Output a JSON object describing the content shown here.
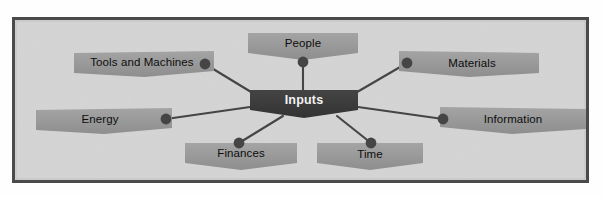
{
  "diagram": {
    "type": "mind-map",
    "title_node": "Inputs",
    "frame": {
      "border_color": "#4a4a4a",
      "background_color": "#d4d4d4",
      "page_color": "#fefefe"
    },
    "colors": {
      "center_fill": "#3c3c3c",
      "center_text": "#f2f2f2",
      "node_fill": "#9a9a9a",
      "node_text": "#0d0d0d",
      "connector": "#454545",
      "dot": "#454545"
    },
    "center": {
      "label": "Inputs",
      "x": 304,
      "y": 103,
      "width": 108,
      "height": 27
    },
    "nodes": [
      {
        "id": "tools-and-machines",
        "label": "Tools and Machines",
        "shape": "ribbon-left",
        "box": {
          "x": 74,
          "y": 51,
          "width": 140,
          "height": 26
        },
        "text_x": 142,
        "text_y": 64,
        "dot": {
          "x": 205,
          "y": 64
        }
      },
      {
        "id": "people",
        "label": "People",
        "shape": "ribbon-notch",
        "box": {
          "x": 248,
          "y": 33,
          "width": 110,
          "height": 26
        },
        "text_x": 303,
        "text_y": 45,
        "dot": {
          "x": 303,
          "y": 62
        }
      },
      {
        "id": "materials",
        "label": "Materials",
        "shape": "ribbon-right",
        "box": {
          "x": 399,
          "y": 51,
          "width": 140,
          "height": 26
        },
        "text_x": 472,
        "text_y": 65,
        "dot": {
          "x": 407,
          "y": 63
        }
      },
      {
        "id": "energy",
        "label": "Energy",
        "shape": "ribbon-left",
        "box": {
          "x": 36,
          "y": 108,
          "width": 136,
          "height": 26
        },
        "text_x": 100,
        "text_y": 121,
        "dot": {
          "x": 166,
          "y": 119
        }
      },
      {
        "id": "information",
        "label": "Information",
        "shape": "ribbon-right",
        "box": {
          "x": 440,
          "y": 107,
          "width": 146,
          "height": 26
        },
        "text_x": 513,
        "text_y": 121,
        "dot": {
          "x": 443,
          "y": 119
        }
      },
      {
        "id": "finances",
        "label": "Finances",
        "shape": "ribbon-notch",
        "box": {
          "x": 185,
          "y": 143,
          "width": 112,
          "height": 26
        },
        "text_x": 241,
        "text_y": 155,
        "dot": {
          "x": 239,
          "y": 143
        }
      },
      {
        "id": "time",
        "label": "Time",
        "shape": "ribbon-notch",
        "box": {
          "x": 317,
          "y": 143,
          "width": 106,
          "height": 26
        },
        "text_x": 370,
        "text_y": 156,
        "dot": {
          "x": 371,
          "y": 143
        }
      }
    ],
    "connectors": [
      {
        "from": "center",
        "to": "tools-and-machines",
        "x1": 256,
        "y1": 95,
        "x2": 205,
        "y2": 64
      },
      {
        "from": "center",
        "to": "people",
        "x1": 303,
        "y1": 92,
        "x2": 303,
        "y2": 62
      },
      {
        "from": "center",
        "to": "materials",
        "x1": 352,
        "y1": 95,
        "x2": 407,
        "y2": 63
      },
      {
        "from": "center",
        "to": "energy",
        "x1": 250,
        "y1": 107,
        "x2": 166,
        "y2": 119
      },
      {
        "from": "center",
        "to": "information",
        "x1": 358,
        "y1": 107,
        "x2": 443,
        "y2": 119
      },
      {
        "from": "center",
        "to": "finances",
        "x1": 283,
        "y1": 116,
        "x2": 239,
        "y2": 143
      },
      {
        "from": "center",
        "to": "time",
        "x1": 337,
        "y1": 116,
        "x2": 371,
        "y2": 143
      }
    ]
  }
}
